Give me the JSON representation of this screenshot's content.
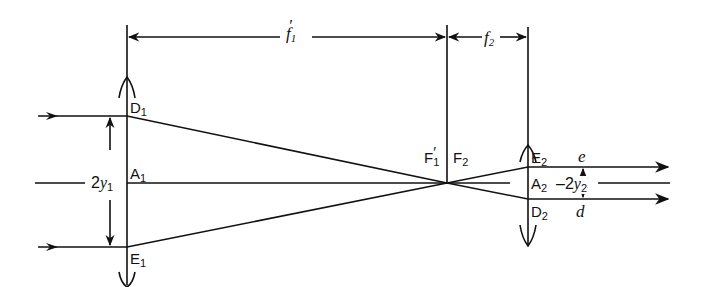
{
  "diagram": {
    "type": "optical ray diagram - Keplerian beam expander / telescope (two converging lenses)",
    "colors": {
      "line": "#111111",
      "background": "#ffffff"
    },
    "dimensions": {
      "f1_prime": {
        "base": "f",
        "sub": "1",
        "prime": "′"
      },
      "f2": {
        "base": "f",
        "sub": "2"
      }
    },
    "lens1": {
      "points": {
        "D1": {
          "base": "D",
          "sub": "1"
        },
        "A1": {
          "base": "A",
          "sub": "1"
        },
        "E1": {
          "base": "E",
          "sub": "1"
        }
      },
      "aperture": {
        "prefix": "2",
        "var": "y",
        "sub": "1"
      }
    },
    "focus": {
      "F1_prime": {
        "base": "F",
        "sub": "1",
        "prime": "′"
      },
      "F2": {
        "base": "F",
        "sub": "2"
      }
    },
    "lens2": {
      "points": {
        "E2": {
          "base": "E",
          "sub": "2"
        },
        "A2": {
          "base": "A",
          "sub": "2"
        },
        "D2": {
          "base": "D",
          "sub": "2"
        }
      },
      "aperture": {
        "prefix": "–2",
        "var": "y",
        "sub": "2"
      }
    },
    "rays": {
      "e": "e",
      "d": "d"
    }
  }
}
